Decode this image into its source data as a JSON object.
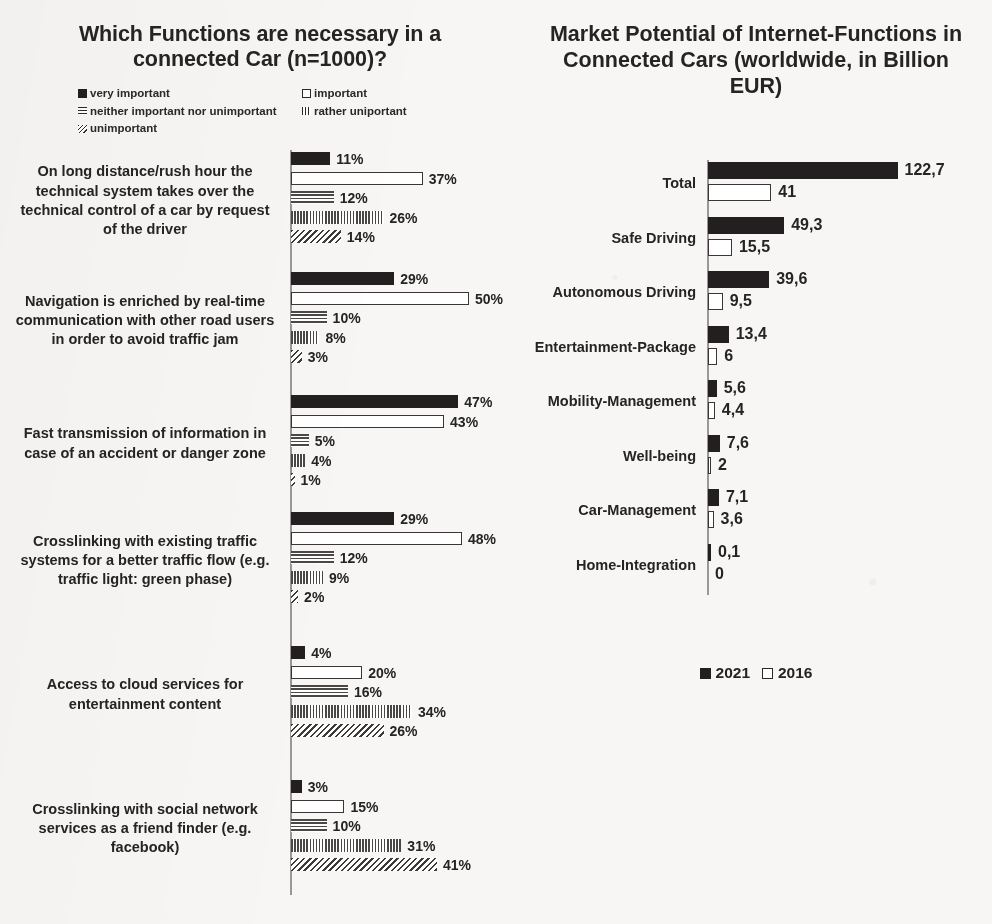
{
  "left": {
    "title": "Which Functions are necessary in a connected Car (n=1000)?",
    "legend": [
      {
        "label": "very important",
        "pattern": "solid"
      },
      {
        "label": "important",
        "pattern": "open"
      },
      {
        "label": "neither important nor unimportant",
        "pattern": "horiz"
      },
      {
        "label": "rather uniportant",
        "pattern": "vert"
      },
      {
        "label": "unimportant",
        "pattern": "diag"
      }
    ]
  },
  "right": {
    "title": "Market Potential of Internet-Functions in Connected Cars (worldwide, in Billion EUR)",
    "legend": [
      {
        "label": "2021",
        "pattern": "solid"
      },
      {
        "label": "2016",
        "pattern": "open"
      }
    ]
  },
  "chart_data": [
    {
      "type": "bar",
      "orientation": "horizontal",
      "title": "Which Functions are necessary in a connected Car (n=1000)?",
      "xlabel": "",
      "ylabel": "",
      "value_suffix": "%",
      "xlim": [
        0,
        55
      ],
      "grid": false,
      "legend_position": "top",
      "categories": [
        "On long distance/rush hour the technical  system  takes over the technical control of a car by request of the driver",
        "Navigation is enriched by real-time communication with other road users in order to avoid traffic jam",
        "Fast transmission of information in case of an accident or danger zone",
        "Crosslinking with existing traffic systems for a better traffic flow (e.g. traffic light: green phase)",
        "Access to cloud services for entertainment content",
        "Crosslinking with social network services as a friend finder (e.g. facebook)"
      ],
      "series": [
        {
          "name": "very important",
          "pattern": "solid",
          "values": [
            11,
            29,
            47,
            29,
            4,
            3
          ],
          "labels": [
            "11%",
            "29%",
            "47%",
            "29%",
            "4%",
            "3%"
          ]
        },
        {
          "name": "important",
          "pattern": "open",
          "values": [
            37,
            50,
            43,
            48,
            20,
            15
          ],
          "labels": [
            "37%",
            "50%",
            "43%",
            "48%",
            "20%",
            "15%"
          ]
        },
        {
          "name": "neither important nor unimportant",
          "pattern": "horiz",
          "values": [
            12,
            10,
            5,
            12,
            16,
            10
          ],
          "labels": [
            "12%",
            "10%",
            "5%",
            "12%",
            "16%",
            "10%"
          ]
        },
        {
          "name": "rather uniportant",
          "pattern": "vert",
          "values": [
            26,
            8,
            4,
            9,
            34,
            31
          ],
          "labels": [
            "26%",
            "8%",
            "4%",
            "9%",
            "34%",
            "31%"
          ]
        },
        {
          "name": "unimportant",
          "pattern": "diag",
          "values": [
            14,
            3,
            1,
            2,
            26,
            41
          ],
          "labels": [
            "14%",
            "3%",
            "1%",
            "2%",
            "26%",
            "41%"
          ]
        }
      ]
    },
    {
      "type": "bar",
      "orientation": "horizontal",
      "title": "Market Potential of Internet-Functions in Connected Cars (worldwide, in Billion EUR)",
      "xlabel": "",
      "ylabel": "",
      "unit": "Billion EUR",
      "xlim": [
        0,
        130
      ],
      "grid": false,
      "legend_position": "bottom",
      "categories": [
        "Total",
        "Safe Driving",
        "Autonomous Driving",
        "Entertainment-Package",
        "Mobility-Management",
        "Well-being",
        "Car-Management",
        "Home-Integration"
      ],
      "series": [
        {
          "name": "2021",
          "pattern": "solid",
          "values": [
            122.7,
            49.3,
            39.6,
            13.4,
            5.6,
            7.6,
            7.1,
            0.1
          ],
          "labels": [
            "122,7",
            "49,3",
            "39,6",
            "13,4",
            "5,6",
            "7,6",
            "7,1",
            "0,1"
          ]
        },
        {
          "name": "2016",
          "pattern": "open",
          "values": [
            41,
            15.5,
            9.5,
            6,
            4.4,
            2,
            3.6,
            0
          ],
          "labels": [
            "41",
            "15,5",
            "9,5",
            "6",
            "4,4",
            "2",
            "3,6",
            "0"
          ]
        }
      ]
    }
  ]
}
